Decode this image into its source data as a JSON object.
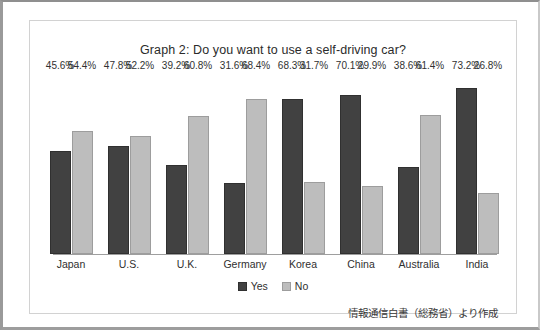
{
  "chart_data": {
    "type": "bar",
    "title": "Graph 2: Do you want to use a self-driving car?",
    "xlabel": "",
    "ylabel": "",
    "ylim": [
      0,
      80
    ],
    "grid": false,
    "legend_position": "bottom-center",
    "categories": [
      "Japan",
      "U.S.",
      "U.K.",
      "Germany",
      "Korea",
      "China",
      "Australia",
      "India"
    ],
    "series": [
      {
        "name": "Yes",
        "color": "#414141",
        "values": [
          45.6,
          47.8,
          39.2,
          31.6,
          68.3,
          70.1,
          38.6,
          73.2
        ],
        "labels": [
          "45.6%",
          "47.8%",
          "39.2%",
          "31.6%",
          "68.3%",
          "70.1%",
          "38.6%",
          "73.2%"
        ]
      },
      {
        "name": "No",
        "color": "#bdbdbd",
        "values": [
          54.4,
          52.2,
          60.8,
          68.4,
          31.7,
          29.9,
          61.4,
          26.8
        ],
        "labels": [
          "54.4%",
          "52.2%",
          "60.8%",
          "68.4%",
          "31.7%",
          "29.9%",
          "61.4%",
          "26.8%"
        ]
      }
    ],
    "annotations": [
      "情報通信白書（総務省）より作成"
    ]
  },
  "legend": {
    "items": [
      {
        "label": "Yes",
        "swatch": "dark-square-swatch"
      },
      {
        "label": "No",
        "swatch": "light-square-swatch"
      }
    ]
  },
  "source_note": "情報通信白書（総務省）より作成"
}
